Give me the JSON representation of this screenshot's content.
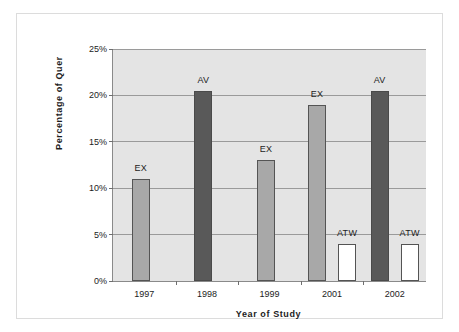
{
  "chart_data": {
    "type": "bar",
    "title": "",
    "xlabel": "Year of Study",
    "ylabel": "Percentage of Quer",
    "categories": [
      "1997",
      "1998",
      "1999",
      "2001",
      "2002"
    ],
    "ytick_labels": [
      "0%",
      "5%",
      "10%",
      "15%",
      "20%",
      "25%"
    ],
    "ytick_values": [
      0,
      5,
      10,
      15,
      20,
      25
    ],
    "ylim": [
      0,
      25
    ],
    "grid": true,
    "legend": "none",
    "colors": {
      "ex": "#a8a8a8",
      "av": "#595959",
      "atw": "#ffffff",
      "bar_border": "#545454",
      "plot_background": "#e4e4e4",
      "gridline": "#9a9a9a",
      "axis": "#8a8a8a",
      "text": "#1c1c1c",
      "frame": "#dcdcdc"
    },
    "bars": [
      {
        "category": "1997",
        "label": "EX",
        "series": "ex",
        "value": 11.0
      },
      {
        "category": "1998",
        "label": "AV",
        "series": "av",
        "value": 20.5
      },
      {
        "category": "1999",
        "label": "EX",
        "series": "ex",
        "value": 13.0
      },
      {
        "category": "2001",
        "label": "EX",
        "series": "ex",
        "value": 19.0
      },
      {
        "category": "2001",
        "label": "ATW",
        "series": "atw",
        "value": 4.0
      },
      {
        "category": "2002",
        "label": "AV",
        "series": "av",
        "value": 20.5
      },
      {
        "category": "2002",
        "label": "ATW",
        "series": "atw",
        "value": 4.0
      }
    ]
  }
}
